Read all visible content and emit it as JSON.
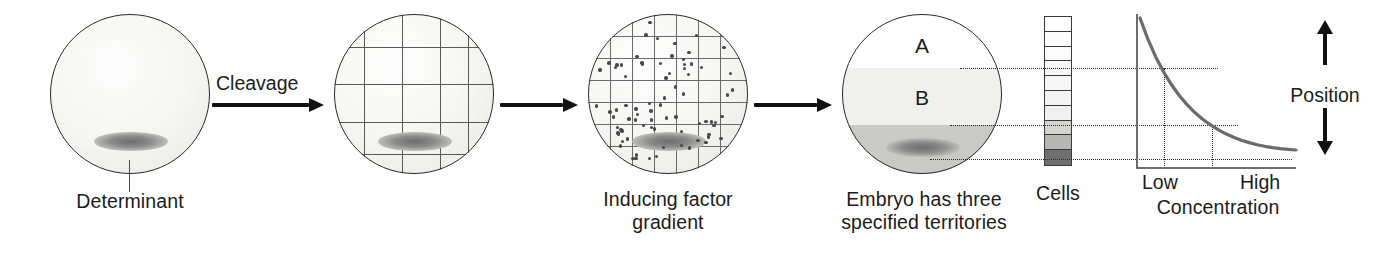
{
  "figure": {
    "type": "biology-schematic"
  },
  "panels": {
    "egg": {
      "label": "Determinant",
      "determinant_label": "Determinant"
    },
    "cleavage": {
      "arrow_label": "Cleavage"
    },
    "gradient": {
      "caption": "Inducing factor\ngradient"
    },
    "territories": {
      "caption": "Embryo has three\nspecified territories",
      "regions": [
        {
          "name": "A",
          "shade": "#ffffff"
        },
        {
          "name": "B",
          "shade": "#f0f0ef"
        },
        {
          "name": "C",
          "shade": "#c9c9c7"
        }
      ]
    },
    "cells": {
      "caption": "Cells",
      "column_shades": [
        "#ffffff",
        "#fdfdfd",
        "#fbfbfb",
        "#f8f8f8",
        "#f6f6f6",
        "#f3f3f3",
        "#f0f0f0",
        "#d4d4d2",
        "#b6b6b4",
        "#6f6f6f"
      ]
    }
  },
  "arrows": [
    {
      "label": "Cleavage"
    },
    {
      "label": ""
    },
    {
      "label": ""
    }
  ],
  "chart_data": {
    "type": "line",
    "title": "",
    "xlabel": "Concentration",
    "ylabel": "Position",
    "xticklabels": [
      "Low",
      "High"
    ],
    "yticklabels": [],
    "grid": false,
    "legend": null,
    "annotations": [
      "Three dotted threshold lines link territory boundaries A/B, B/C and the determinant to concentration values on the curve."
    ],
    "series": [
      {
        "name": "Inducing factor concentration vs position",
        "shape": "exponential-decay",
        "x": [
          0.0,
          0.05,
          0.1,
          0.15,
          0.2,
          0.25,
          0.3,
          0.35,
          0.4,
          0.45,
          0.5,
          0.55,
          0.6,
          0.65,
          0.7,
          0.75,
          0.8,
          0.85,
          0.9,
          0.95,
          1.0
        ],
        "y": [
          1.0,
          0.86,
          0.74,
          0.64,
          0.555,
          0.482,
          0.42,
          0.367,
          0.322,
          0.284,
          0.251,
          0.223,
          0.2,
          0.18,
          0.164,
          0.15,
          0.139,
          0.13,
          0.123,
          0.118,
          0.114
        ]
      }
    ],
    "thresholds": [
      {
        "name": "A/B boundary",
        "y": 0.62,
        "x": 0.155
      },
      {
        "name": "B/C boundary",
        "y": 0.275,
        "x": 0.455
      },
      {
        "name": "determinant level",
        "y": 0.125,
        "x": 0.875
      }
    ],
    "xlim": [
      0,
      1
    ],
    "ylim": [
      0,
      1
    ]
  },
  "position_axis": {
    "label": "Position",
    "arrow": "double-vertical"
  },
  "colors": {
    "ink": "#1b1b1b",
    "outline": "#2b2b2b",
    "grid": "#59595a",
    "curve": "#6b6b6d",
    "dotted": "#2a2a2a",
    "territory_a": "#ffffff",
    "territory_b": "#f0f0ef",
    "territory_c": "#c9c9c7",
    "determinant": "#6d6d6d"
  }
}
